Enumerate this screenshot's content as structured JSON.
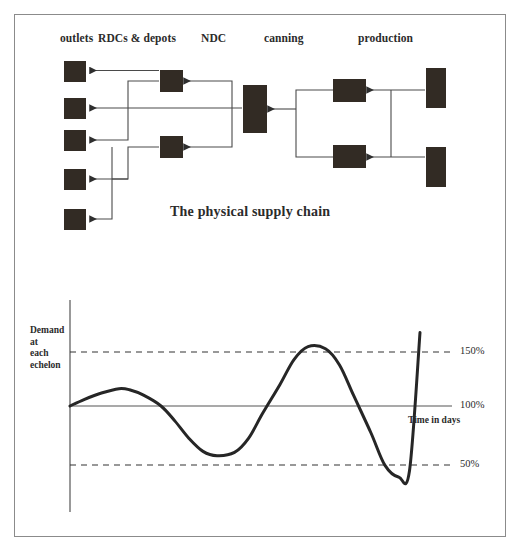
{
  "figure": {
    "caption": "The physical supply chain",
    "border_color": "#8b8b8b",
    "node_color": "#322b24",
    "line_color": "#4a4a4a"
  },
  "supply_chain": {
    "column_headers": [
      {
        "label": "outlets",
        "x": 60,
        "y": 32
      },
      {
        "label": "RDCs & depots",
        "x": 98,
        "y": 32
      },
      {
        "label": "NDC",
        "x": 201,
        "y": 32
      },
      {
        "label": "canning",
        "x": 264,
        "y": 32
      },
      {
        "label": "production",
        "x": 358,
        "y": 32
      }
    ],
    "nodes": [
      {
        "name": "outlet-1",
        "tier": "outlets",
        "x": 64,
        "y": 61,
        "w": 22,
        "h": 21
      },
      {
        "name": "outlet-2",
        "tier": "outlets",
        "x": 64,
        "y": 98,
        "w": 22,
        "h": 21
      },
      {
        "name": "outlet-3",
        "tier": "outlets",
        "x": 64,
        "y": 130,
        "w": 22,
        "h": 21
      },
      {
        "name": "outlet-4",
        "tier": "outlets",
        "x": 64,
        "y": 169,
        "w": 22,
        "h": 21
      },
      {
        "name": "outlet-5",
        "tier": "outlets",
        "x": 64,
        "y": 209,
        "w": 22,
        "h": 21
      },
      {
        "name": "rdc-1",
        "tier": "rdcs",
        "x": 160,
        "y": 70,
        "w": 23,
        "h": 22
      },
      {
        "name": "rdc-2",
        "tier": "rdcs",
        "x": 160,
        "y": 136,
        "w": 23,
        "h": 22
      },
      {
        "name": "ndc-1",
        "tier": "ndc",
        "x": 243,
        "y": 85,
        "w": 24,
        "h": 48
      },
      {
        "name": "canning-1",
        "tier": "canning",
        "x": 333,
        "y": 79,
        "w": 33,
        "h": 23
      },
      {
        "name": "canning-2",
        "tier": "canning",
        "x": 333,
        "y": 145,
        "w": 33,
        "h": 23
      },
      {
        "name": "production-1",
        "tier": "production",
        "x": 426,
        "y": 68,
        "w": 20,
        "h": 40
      },
      {
        "name": "production-2",
        "tier": "production",
        "x": 426,
        "y": 147,
        "w": 20,
        "h": 40
      }
    ]
  },
  "chart_data": {
    "type": "line",
    "title": "",
    "xlabel": "Time in days",
    "ylabel": "Demand at each echelon",
    "ylabel_lines": [
      "Demand",
      "at",
      "each",
      "echelon"
    ],
    "y_tick_labels": [
      "150%",
      "100%",
      "50%"
    ],
    "y_tick_values": [
      150,
      100,
      50
    ],
    "ylim": [
      0,
      190
    ],
    "xlim": [
      0,
      100
    ],
    "grid": true,
    "gridline_style": {
      "150": "dashed",
      "100": "solid",
      "50": "dashed"
    },
    "legend": "none",
    "series": [
      {
        "name": "demand amplification",
        "x": [
          0,
          4,
          9,
          14,
          17,
          21,
          26,
          30,
          34,
          38,
          42,
          47,
          51,
          55,
          60,
          64,
          68,
          73,
          77,
          81,
          86,
          90,
          94,
          97,
          100
        ],
        "values": [
          100,
          106,
          112,
          116,
          115,
          110,
          100,
          86,
          70,
          58,
          54,
          57,
          70,
          93,
          120,
          143,
          155,
          153,
          138,
          110,
          75,
          45,
          34,
          40,
          168
        ]
      }
    ],
    "annotations": [
      {
        "text": "150%",
        "x": 100,
        "y": 150
      },
      {
        "text": "100%",
        "x": 100,
        "y": 100
      },
      {
        "text": "50%",
        "x": 100,
        "y": 50
      },
      {
        "text": "Time in days",
        "x": 84,
        "y": 88
      }
    ],
    "axes_px": {
      "y_axis_x": 70,
      "y_axis_top": 300,
      "y_axis_bottom": 512,
      "x_axis_y": 406,
      "x_axis_left": 70,
      "x_axis_right": 418,
      "gridline_left": 70,
      "gridline_right": 452,
      "y150_px": 352,
      "y100_px": 406,
      "y50_px": 465,
      "plot_left": 70,
      "plot_right": 420
    },
    "tick_label_x": 460,
    "xlabel_px": {
      "x": 408,
      "y": 418
    }
  }
}
